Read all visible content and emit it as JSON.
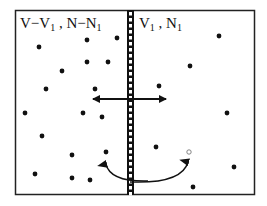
{
  "diagram": {
    "left_region_label": {
      "main": "V−V",
      "sub1": "1",
      "mid": " , N−N",
      "sub2": "1"
    },
    "right_region_label": {
      "main": "V",
      "sub1": "1",
      "mid": " , N",
      "sub2": "1"
    },
    "colors": {
      "ink": "#111111",
      "background": "#ffffff",
      "wall_fill": "#ffffff"
    },
    "box": {
      "x": 15,
      "y": 10,
      "width": 239,
      "height": 184
    },
    "wall": {
      "x": 127,
      "width": 7
    },
    "particles_filled": [
      [
        39,
        47
      ],
      [
        87,
        40
      ],
      [
        117,
        38
      ],
      [
        87,
        62
      ],
      [
        108,
        62
      ],
      [
        62,
        71
      ],
      [
        46,
        89
      ],
      [
        95,
        89
      ],
      [
        25,
        113
      ],
      [
        83,
        113
      ],
      [
        102,
        117
      ],
      [
        42,
        136
      ],
      [
        72,
        155
      ],
      [
        106,
        152
      ],
      [
        35,
        174
      ],
      [
        72,
        178
      ],
      [
        90,
        180
      ],
      [
        219,
        36
      ],
      [
        190,
        66
      ],
      [
        159,
        86
      ],
      [
        227,
        113
      ],
      [
        156,
        147
      ],
      [
        234,
        167
      ],
      [
        193,
        187
      ]
    ],
    "particles_open": [
      [
        189,
        152
      ]
    ],
    "exchange_arrow": {
      "y": 99,
      "x1": 93,
      "x2": 166
    },
    "transfer_arc": {
      "from": [
        106,
        162
      ],
      "to": [
        188,
        160
      ],
      "bottom_y": 182
    }
  }
}
